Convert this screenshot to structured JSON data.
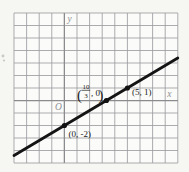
{
  "figure": {
    "canvas": {
      "width": 189,
      "height": 172
    },
    "colors": {
      "background": "#f6f6f2",
      "paper": "#fbfbf9",
      "grid_line": "#9d9da2",
      "axis_line": "#8a8a8f",
      "plot_line": "#141414",
      "point_dot": "#111111",
      "point_label": "#1c1c1c",
      "axis_label": "#909095",
      "artifact": "#c9c9c4"
    },
    "grid": {
      "left": 14,
      "top": 13,
      "cols": 13,
      "rows": 12,
      "cell_w": 12.6,
      "cell_h": 12.5
    },
    "origin": {
      "col": 4,
      "row": 7
    },
    "axis_labels": {
      "y": "y",
      "x": "x",
      "origin": "O"
    },
    "axis_label_pos": {
      "y": {
        "dx": 3.2,
        "y_from_top": 9
      },
      "x": {
        "x_from_right": 10.5,
        "dy": -4
      },
      "origin": {
        "dx": -9.5,
        "dy": 9.5
      }
    },
    "artifact_mark": {
      "x": 3,
      "y": 56
    }
  },
  "chart_data": {
    "type": "line",
    "title": "",
    "xlabel": "x",
    "ylabel": "y",
    "grid": true,
    "xlim": [
      -4,
      9
    ],
    "ylim": [
      -5,
      7
    ],
    "line": {
      "slope": 0.6,
      "intercept": -2,
      "x_range_units": [
        -4,
        9
      ],
      "equation": "y = (3/5)x - 2"
    },
    "points": [
      {
        "x": 0,
        "y": -2,
        "label": "(0, -2)",
        "label_offset": {
          "dx": 4,
          "dy": 11,
          "anchor": "start"
        }
      },
      {
        "x": 3.3333,
        "y": 0,
        "label": "(10/3, 0)",
        "label_fraction": {
          "open": "(",
          "numerator": "10",
          "denominator": "3",
          "rest": ", 0",
          "close": ")",
          "dx": -29.5,
          "dy": -4.5
        }
      },
      {
        "x": 5,
        "y": 1,
        "label": "(5, 1)",
        "label_offset": {
          "dx": 4.5,
          "dy": 6.5,
          "anchor": "start"
        }
      }
    ],
    "dot_radius": 2.6,
    "line_width": 2.8
  }
}
